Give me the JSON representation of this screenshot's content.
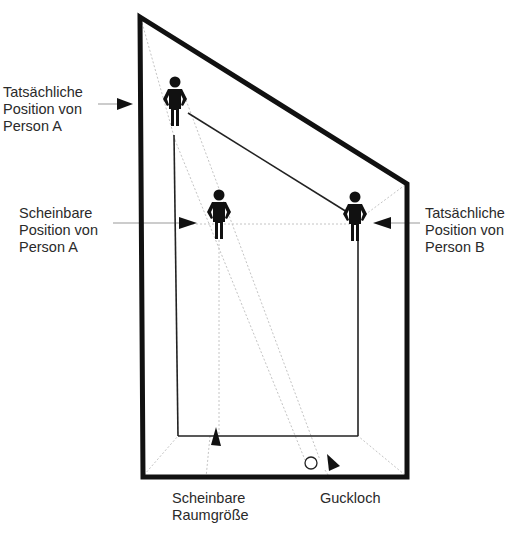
{
  "diagram": {
    "colors": {
      "outline": "#111111",
      "inner_line": "#222222",
      "guide_line": "#bbbbbb",
      "text": "#2a2a2a"
    },
    "labels": {
      "actual_a": {
        "line1": "Tatsächliche",
        "line2": "Position von",
        "line3": "Person A"
      },
      "apparent_a": {
        "line1": "Scheinbare",
        "line2": "Position von",
        "line3": "Person A"
      },
      "actual_b": {
        "line1": "Tatsächliche",
        "line2": "Position von",
        "line3": "Person B"
      },
      "apparent_size": {
        "line1": "Scheinbare",
        "line2": "Raumgröße"
      },
      "peephole": {
        "line1": "Guckloch"
      }
    },
    "figures": [
      {
        "id": "person-a-actual",
        "x": 175,
        "y": 75
      },
      {
        "id": "person-a-apparent",
        "x": 219,
        "y": 190
      },
      {
        "id": "person-b-actual",
        "x": 355,
        "y": 192
      }
    ],
    "peephole_icon": "circle-icon"
  }
}
